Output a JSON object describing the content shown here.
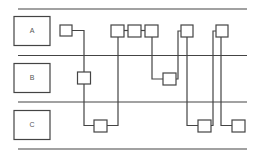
{
  "diagram": {
    "type": "swimlane",
    "lanes": [
      {
        "id": "A",
        "label": "A"
      },
      {
        "id": "B",
        "label": "B"
      },
      {
        "id": "C",
        "label": "C"
      }
    ],
    "stroke_color": "#444444",
    "background": "#ffffff"
  }
}
